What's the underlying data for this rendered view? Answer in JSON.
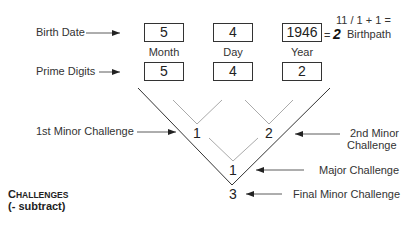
{
  "labels": {
    "birth_date": "Birth Date",
    "prime_digits": "Prime Digits",
    "first_minor": "1st Minor Challenge",
    "second_minor_line1": "2nd Minor",
    "second_minor_line2": "Challenge",
    "major": "Major Challenge",
    "final_minor": "Final Minor Challenge"
  },
  "birth_date": {
    "month": "5",
    "day": "4",
    "year": "1946"
  },
  "columns": {
    "month": "Month",
    "day": "Day",
    "year": "Year"
  },
  "prime_digits": {
    "month": "5",
    "day": "4",
    "year": "2"
  },
  "birthpath": {
    "equation": "11 / 1 + 1 =",
    "equals": "=",
    "value": "2",
    "label": "Birthpath"
  },
  "challenges": {
    "first_minor": "1",
    "second_minor": "2",
    "major": "1",
    "final_minor": "3"
  },
  "legend": {
    "title_first": "C",
    "title_rest": "HALLENGES",
    "subtitle": "(- subtract)"
  },
  "colors": {
    "line_dark": "#333333",
    "line_light": "#aaaaaa",
    "text": "#222222"
  }
}
